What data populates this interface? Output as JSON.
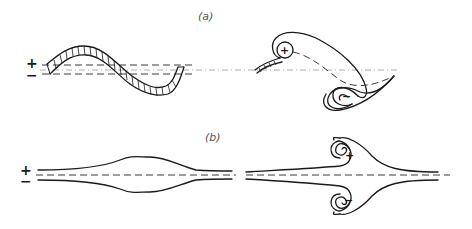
{
  "figure": {
    "panel_a": {
      "label": "(a)",
      "left_sign_top": "+",
      "left_sign_bottom": "−",
      "vortex_top_sign": "+",
      "vortex_bottom_sign": "−"
    },
    "panel_b": {
      "label": "(b)",
      "left_sign_top": "+",
      "left_sign_bottom": "−",
      "vortex_top_sign": "+",
      "vortex_bottom_sign": "−"
    }
  },
  "colors": {
    "line": "#1a1a1a",
    "dash": "#3a3a3a",
    "axis": "#9a9a9a",
    "label": "#555555",
    "background": "#ffffff"
  }
}
